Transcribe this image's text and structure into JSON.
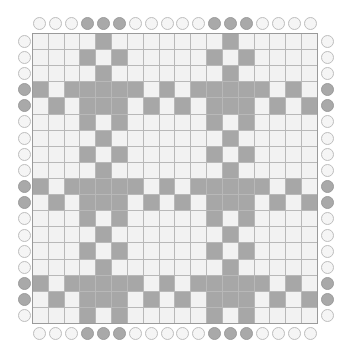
{
  "puzzle": {
    "rows": 18,
    "cols": 18,
    "colors": {
      "filled": "#a7a7a7",
      "empty": "#f2f2f2",
      "gridline": "#b8b8b8",
      "clue_filled": "#a9a9a9",
      "clue_empty": "#f5f5f5"
    },
    "top_clues": [
      0,
      0,
      0,
      1,
      1,
      1,
      0,
      0,
      0,
      0,
      0,
      1,
      1,
      1,
      0,
      0,
      0,
      0
    ],
    "bottom_clues": [
      0,
      0,
      0,
      1,
      1,
      1,
      0,
      0,
      0,
      0,
      0,
      1,
      1,
      1,
      0,
      0,
      0,
      0
    ],
    "left_clues": [
      0,
      0,
      0,
      1,
      1,
      0,
      0,
      0,
      0,
      1,
      1,
      0,
      0,
      0,
      0,
      1,
      1,
      0
    ],
    "right_clues": [
      0,
      0,
      0,
      1,
      1,
      0,
      0,
      0,
      0,
      1,
      1,
      0,
      0,
      0,
      0,
      1,
      1,
      0
    ],
    "grid": [
      [
        0,
        0,
        0,
        0,
        1,
        0,
        0,
        0,
        0,
        0,
        0,
        0,
        1,
        0,
        0,
        0,
        0,
        0
      ],
      [
        0,
        0,
        0,
        1,
        0,
        1,
        0,
        0,
        0,
        0,
        0,
        1,
        0,
        1,
        0,
        0,
        0,
        0
      ],
      [
        0,
        0,
        0,
        0,
        1,
        0,
        0,
        0,
        0,
        0,
        0,
        0,
        1,
        0,
        0,
        0,
        0,
        0
      ],
      [
        1,
        0,
        1,
        1,
        1,
        1,
        1,
        0,
        1,
        0,
        1,
        1,
        1,
        1,
        1,
        0,
        1,
        0
      ],
      [
        0,
        1,
        0,
        1,
        1,
        1,
        0,
        1,
        0,
        1,
        0,
        1,
        1,
        1,
        0,
        1,
        0,
        1
      ],
      [
        0,
        0,
        0,
        1,
        0,
        1,
        0,
        0,
        0,
        0,
        0,
        1,
        0,
        1,
        0,
        0,
        0,
        0
      ],
      [
        0,
        0,
        0,
        0,
        1,
        0,
        0,
        0,
        0,
        0,
        0,
        0,
        1,
        0,
        0,
        0,
        0,
        0
      ],
      [
        0,
        0,
        0,
        1,
        0,
        1,
        0,
        0,
        0,
        0,
        0,
        1,
        0,
        1,
        0,
        0,
        0,
        0
      ],
      [
        0,
        0,
        0,
        0,
        1,
        0,
        0,
        0,
        0,
        0,
        0,
        0,
        1,
        0,
        0,
        0,
        0,
        0
      ],
      [
        1,
        0,
        1,
        1,
        1,
        1,
        1,
        0,
        1,
        0,
        1,
        1,
        1,
        1,
        1,
        0,
        1,
        0
      ],
      [
        0,
        1,
        0,
        1,
        1,
        1,
        0,
        1,
        0,
        1,
        0,
        1,
        1,
        1,
        0,
        1,
        0,
        1
      ],
      [
        0,
        0,
        0,
        1,
        0,
        1,
        0,
        0,
        0,
        0,
        0,
        1,
        0,
        1,
        0,
        0,
        0,
        0
      ],
      [
        0,
        0,
        0,
        0,
        1,
        0,
        0,
        0,
        0,
        0,
        0,
        0,
        1,
        0,
        0,
        0,
        0,
        0
      ],
      [
        0,
        0,
        0,
        1,
        0,
        1,
        0,
        0,
        0,
        0,
        0,
        1,
        0,
        1,
        0,
        0,
        0,
        0
      ],
      [
        0,
        0,
        0,
        0,
        1,
        0,
        0,
        0,
        0,
        0,
        0,
        0,
        1,
        0,
        0,
        0,
        0,
        0
      ],
      [
        1,
        0,
        1,
        1,
        1,
        1,
        1,
        0,
        1,
        0,
        1,
        1,
        1,
        1,
        1,
        0,
        1,
        0
      ],
      [
        0,
        1,
        0,
        1,
        1,
        1,
        0,
        1,
        0,
        1,
        0,
        1,
        1,
        1,
        0,
        1,
        0,
        1
      ],
      [
        0,
        0,
        0,
        1,
        0,
        1,
        0,
        0,
        0,
        0,
        0,
        1,
        0,
        1,
        0,
        0,
        0,
        0
      ]
    ]
  }
}
